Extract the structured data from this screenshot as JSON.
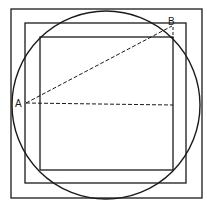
{
  "diagram": {
    "labels": {
      "a": "A",
      "b": "B"
    },
    "colors": {
      "stroke": "#1a1a1a",
      "background": "#ffffff"
    },
    "shapes": {
      "outer_square": {
        "x": 11,
        "y": 9,
        "w": 191,
        "h": 189
      },
      "middle_square": {
        "x": 25,
        "y": 23,
        "w": 161,
        "h": 160
      },
      "inner_square": {
        "x": 40,
        "y": 37,
        "w": 133,
        "h": 133
      },
      "circle": {
        "cx": 106,
        "cy": 105,
        "r": 94
      },
      "dashed_line_AB": {
        "x1": 26,
        "y1": 103,
        "x2": 172,
        "y2": 26
      },
      "dashed_line_horizontal": {
        "x1": 26,
        "y1": 103,
        "x2": 173,
        "y2": 105
      },
      "dashed_line_vertical_B": {
        "x1": 173,
        "y1": 26,
        "x2": 173,
        "y2": 38
      }
    }
  }
}
